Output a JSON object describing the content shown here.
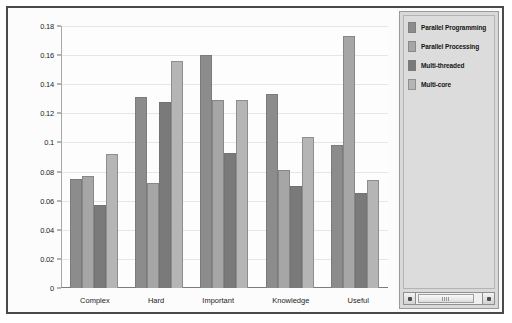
{
  "chart_data": {
    "type": "bar",
    "title": "",
    "xlabel": "",
    "ylabel": "",
    "categories": [
      "Complex",
      "Hard",
      "Important",
      "Knowledge",
      "Useful"
    ],
    "series": [
      {
        "name": "Parallel Programming",
        "color": "#8c8c8c",
        "values": [
          0.075,
          0.131,
          0.16,
          0.133,
          0.098
        ]
      },
      {
        "name": "Parallel Processing",
        "color": "#a6a6a6",
        "values": [
          0.077,
          0.072,
          0.129,
          0.081,
          0.173
        ]
      },
      {
        "name": "Multi-threaded",
        "color": "#7a7a7a",
        "values": [
          0.057,
          0.128,
          0.093,
          0.07,
          0.065
        ]
      },
      {
        "name": "Multi-core",
        "color": "#b5b5b5",
        "values": [
          0.092,
          0.156,
          0.129,
          0.104,
          0.074
        ]
      }
    ],
    "ylim": [
      0,
      0.18
    ],
    "yticks": [
      0,
      0.02,
      0.04,
      0.06,
      0.08,
      0.1,
      0.12,
      0.14,
      0.16,
      0.18
    ],
    "ytick_labels": [
      "0",
      "0.02",
      "0.04",
      "0.06",
      "0.08",
      "0.1",
      "0.12",
      "0.14",
      "0.16",
      "0.18"
    ],
    "grid": true,
    "legend_position": "right"
  },
  "legend": {
    "items": [
      {
        "label": "Parallel Programming",
        "color": "#8c8c8c"
      },
      {
        "label": "Parallel Processing",
        "color": "#a6a6a6"
      },
      {
        "label": "Multi-threaded",
        "color": "#7a7a7a"
      },
      {
        "label": "Multi-core",
        "color": "#b5b5b5"
      }
    ]
  },
  "scrollbar": {
    "left_arrow": "◄",
    "right_arrow": "►"
  }
}
